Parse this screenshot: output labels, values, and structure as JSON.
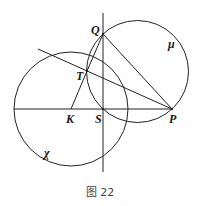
{
  "figure": {
    "caption": "图 22",
    "points": {
      "Q": {
        "label": "Q",
        "x": 103,
        "y": 34
      },
      "T": {
        "label": "T",
        "x": 87,
        "y": 71
      },
      "K": {
        "label": "K",
        "x": 71,
        "y": 109
      },
      "S": {
        "label": "S",
        "x": 103,
        "y": 109
      },
      "P": {
        "label": "P",
        "x": 172,
        "y": 109
      }
    },
    "circles": {
      "chi": {
        "label": "χ",
        "cx": 71,
        "cy": 109,
        "r": 57
      },
      "mu": {
        "label": "μ",
        "cx": 137.5,
        "cy": 71.5,
        "r": 51
      }
    },
    "lines": [
      {
        "name": "vertical-line-through-Q-S",
        "from": [
          103,
          13
        ],
        "to": [
          103,
          172
        ]
      },
      {
        "name": "horizontal-line-K-S-P",
        "from": [
          14,
          109
        ],
        "to": [
          172,
          109
        ]
      },
      {
        "name": "segment-Q-P",
        "from": [
          103,
          34
        ],
        "to": [
          172,
          109
        ]
      },
      {
        "name": "line-through-T-to-P",
        "from": [
          38,
          49
        ],
        "to": [
          172,
          109
        ]
      },
      {
        "name": "segment-K-T",
        "from": [
          71,
          109
        ],
        "to": [
          87,
          71
        ]
      },
      {
        "name": "segment-T-Q",
        "from": [
          87,
          71
        ],
        "to": [
          103,
          34
        ]
      }
    ],
    "stroke_color": "#222222"
  }
}
